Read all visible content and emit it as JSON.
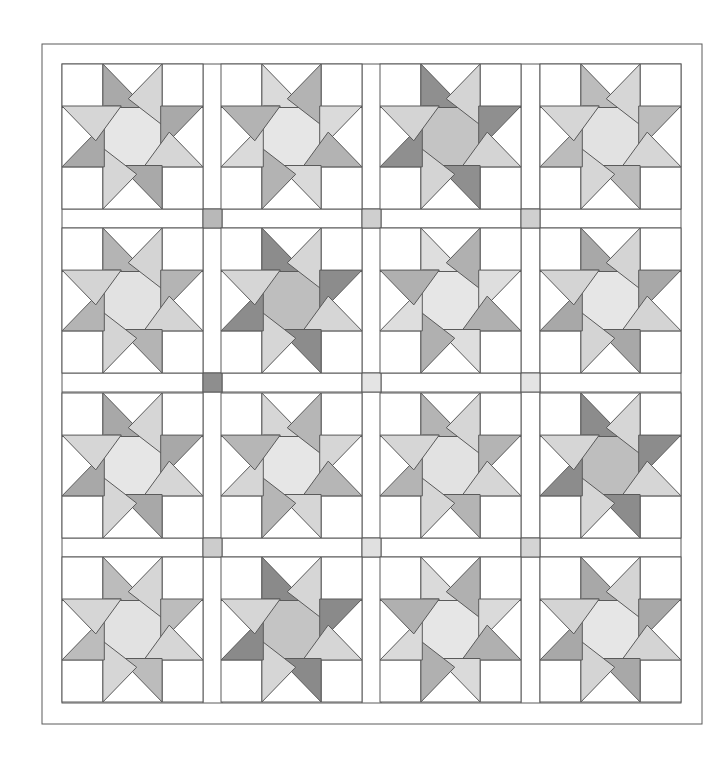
{
  "quilt": {
    "outer_border": {
      "x": 42,
      "y": 44,
      "w": 660,
      "h": 680
    },
    "inner_area": {
      "x": 62,
      "y": 64,
      "w": 619,
      "h": 639
    },
    "col_x": [
      62,
      221,
      380,
      540
    ],
    "row_y": [
      64,
      228,
      393,
      557
    ],
    "block_w": 141,
    "block_h": 145,
    "sash": 19,
    "line_color": "#5a5a5a",
    "background": "#ffffff",
    "cornerstones": [
      {
        "row": 0,
        "col": 0,
        "color": "#b8b8b8"
      },
      {
        "row": 0,
        "col": 1,
        "color": "#cfcfcf"
      },
      {
        "row": 0,
        "col": 2,
        "color": "#cfcfcf"
      },
      {
        "row": 1,
        "col": 0,
        "color": "#8e8e8e"
      },
      {
        "row": 1,
        "col": 1,
        "color": "#e4e4e4"
      },
      {
        "row": 1,
        "col": 2,
        "color": "#e4e4e4"
      },
      {
        "row": 2,
        "col": 0,
        "color": "#cccccc"
      },
      {
        "row": 2,
        "col": 1,
        "color": "#e0e0e0"
      },
      {
        "row": 2,
        "col": 2,
        "color": "#d4d4d4"
      }
    ],
    "blocks": [
      {
        "row": 0,
        "col": 0,
        "a": "#a9a9a9",
        "b": "#d6d6d6",
        "center": "#e6e6e6"
      },
      {
        "row": 0,
        "col": 1,
        "a": "#dadada",
        "b": "#b3b3b3",
        "center": "#e6e6e6"
      },
      {
        "row": 0,
        "col": 2,
        "a": "#8f8f8f",
        "b": "#d4d4d4",
        "center": "#c4c4c4"
      },
      {
        "row": 0,
        "col": 3,
        "a": "#bcbcbc",
        "b": "#d6d6d6",
        "center": "#e2e2e2"
      },
      {
        "row": 1,
        "col": 0,
        "a": "#b4b4b4",
        "b": "#d4d4d4",
        "center": "#e2e2e2"
      },
      {
        "row": 1,
        "col": 1,
        "a": "#8c8c8c",
        "b": "#d6d6d6",
        "center": "#bebebe"
      },
      {
        "row": 1,
        "col": 2,
        "a": "#dedede",
        "b": "#b0b0b0",
        "center": "#e6e6e6"
      },
      {
        "row": 1,
        "col": 3,
        "a": "#a8a8a8",
        "b": "#d4d4d4",
        "center": "#e6e6e6"
      },
      {
        "row": 2,
        "col": 0,
        "a": "#a8a8a8",
        "b": "#d6d6d6",
        "center": "#e6e6e6"
      },
      {
        "row": 2,
        "col": 1,
        "a": "#d6d6d6",
        "b": "#b6b6b6",
        "center": "#e6e6e6"
      },
      {
        "row": 2,
        "col": 2,
        "a": "#b4b4b4",
        "b": "#d6d6d6",
        "center": "#e2e2e2"
      },
      {
        "row": 2,
        "col": 3,
        "a": "#8c8c8c",
        "b": "#d6d6d6",
        "center": "#bebebe"
      },
      {
        "row": 3,
        "col": 0,
        "a": "#bcbcbc",
        "b": "#d6d6d6",
        "center": "#e2e2e2"
      },
      {
        "row": 3,
        "col": 1,
        "a": "#8a8a8a",
        "b": "#d6d6d6",
        "center": "#c4c4c4"
      },
      {
        "row": 3,
        "col": 2,
        "a": "#dadada",
        "b": "#b0b0b0",
        "center": "#e6e6e6"
      },
      {
        "row": 3,
        "col": 3,
        "a": "#a8a8a8",
        "b": "#d4d4d4",
        "center": "#e6e6e6"
      }
    ]
  }
}
